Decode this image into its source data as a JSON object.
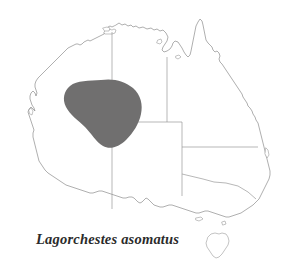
{
  "figure": {
    "caption": "Lagorchestes asomatus",
    "background_color": "#ffffff",
    "width": 283,
    "height": 270
  },
  "map": {
    "region_name": "Australia",
    "coastline_color": "#8c8c8c",
    "border_color": "#9a9a9a",
    "land_fill": "#ffffff",
    "islands": [
      {
        "name": "tasmania"
      },
      {
        "name": "kangaroo-island"
      },
      {
        "name": "melville-island"
      },
      {
        "name": "groote-eylandt"
      },
      {
        "name": "mornington-island"
      },
      {
        "name": "fraser-island"
      },
      {
        "name": "dirk-hartog-island"
      },
      {
        "name": "king-island"
      }
    ],
    "state_borders": [
      {
        "name": "wa-nt-sa-meridian"
      },
      {
        "name": "nt-sa-parallel"
      },
      {
        "name": "nt-qld-meridian"
      },
      {
        "name": "qld-nsw-parallel"
      },
      {
        "name": "sa-nsw-vic-meridian"
      },
      {
        "name": "nsw-vic-line"
      }
    ]
  },
  "range": {
    "species": "Lagorchestes asomatus",
    "common_name": "",
    "shading_color": "#706f6f",
    "label": "distribution-range-polygon"
  }
}
